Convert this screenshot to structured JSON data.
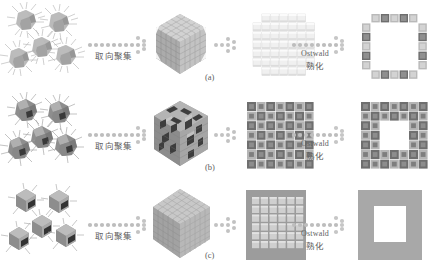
{
  "figure": {
    "type": "schematic-diagram",
    "background_color": "#ffffff",
    "rows": [
      {
        "id": "a",
        "panel_label": "(a)",
        "stage_1": {
          "name": "spiky-nanoparticles",
          "count": 5,
          "style": "hairy spiky irregular particles",
          "color": "#a8a8a8"
        },
        "arrow_1": {
          "label_zh": "取向聚集",
          "label_en": ""
        },
        "stage_2": {
          "name": "cube-aggregate",
          "style": "smooth dense cube of stacked nanocubes",
          "color": "#b6b6b6"
        },
        "stage_3": {
          "name": "grid-array",
          "rows": 7,
          "cols": 7,
          "style": "pale light blocks",
          "color": "#ececec"
        },
        "arrow_2": {
          "label_en": "Ostwald",
          "label_zh": "熟化"
        },
        "stage_4": {
          "name": "hollow-box",
          "style": "square ring of alternating light and dark blocks",
          "colors": [
            "#b9b9b9",
            "#6e6e6e"
          ]
        }
      },
      {
        "id": "b",
        "panel_label": "(b)",
        "stage_1": {
          "name": "spiky-nanoparticles",
          "count": 5,
          "style": "spiky particles with dark facets",
          "color": "#9a9a9a"
        },
        "arrow_1": {
          "label_zh": "取向聚集",
          "label_en": ""
        },
        "stage_2": {
          "name": "cube-aggregate",
          "style": "porous defective cube with dark voids",
          "color": "#9e9e9e"
        },
        "stage_3": {
          "name": "grid-array",
          "rows": 7,
          "cols": 7,
          "style": "checkerboard of dark and mid grey blocks",
          "colors": [
            "#6f6f6f",
            "#b5b5b5"
          ]
        },
        "arrow_2": {
          "label_en": "Ostwald",
          "label_zh": "熟化"
        },
        "stage_4": {
          "name": "hollow-box",
          "style": "thick square ring, checkerboard blocks, white hollow centre",
          "colors": [
            "#6f6f6f",
            "#b5b5b5"
          ]
        }
      },
      {
        "id": "c",
        "panel_label": "(c)",
        "stage_1": {
          "name": "cube-nanoparticles",
          "count": 5,
          "style": "clean cubes with few whiskers and dark facet",
          "color": "#9d9d9d"
        },
        "arrow_1": {
          "label_zh": "取向聚集",
          "label_en": ""
        },
        "stage_2": {
          "name": "cube-aggregate",
          "style": "smooth uniform large cube",
          "color": "#b0b0b0"
        },
        "stage_3": {
          "name": "grid-array",
          "rows": 6,
          "cols": 6,
          "style": "light blocks on solid grey slab",
          "colors": [
            "#9c9c9c",
            "#cfcfcf"
          ]
        },
        "arrow_2": {
          "label_en": "Ostwald",
          "label_zh": "熟化"
        },
        "stage_4": {
          "name": "hollow-box",
          "style": "solid grey square frame with white hollow centre",
          "colors": [
            "#a8a8a8",
            "#ffffff"
          ]
        }
      }
    ]
  }
}
